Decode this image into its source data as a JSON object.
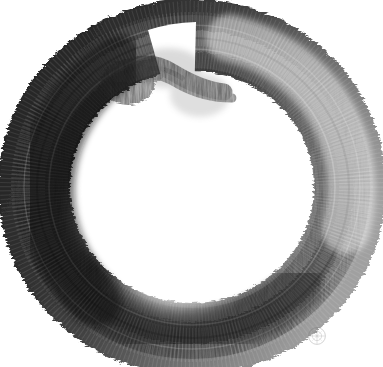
{
  "artwork": {
    "title": "Enso",
    "subject": "enso-zen-circle",
    "medium": "sumi ink brush painting",
    "orientation": "portrait",
    "canvas": {
      "width": 383,
      "height": 367
    },
    "background_color": "#ffffff"
  },
  "ring": {
    "name": "enso-brush-ring",
    "center_x": 192,
    "center_y": 187,
    "radius_x": 160,
    "radius_y": 155,
    "stroke_width": 66,
    "gap_present": true,
    "gap_angle_deg": 285,
    "overlap_point_x": 150,
    "overlap_point_y": 80,
    "direction": "counter-clockwise",
    "texture": "dry-brush radial bristle striations",
    "edge_quality": "ragged serrated outer edge, soft feathered inner edge"
  },
  "tones": {
    "darkest": "#161616",
    "dark": "#2b2b2b",
    "mid_dark": "#3f3f3f",
    "mid": "#595959",
    "mid_light": "#7d7d7d",
    "light": "#a2a2a2",
    "lightest": "#c9c9c9",
    "paper": "#ffffff",
    "highlight_glow": "#ffffff"
  },
  "regions": [
    {
      "name": "top-left-arc",
      "tone": "#2e2e2e",
      "note": "dense dark ink, heavy load"
    },
    {
      "name": "left-arc",
      "tone": "#232323",
      "note": "darkest mass, ragged outer bristles"
    },
    {
      "name": "bottom-left-arc",
      "tone": "#2a2a2a",
      "note": "dark with white glow at inner edge"
    },
    {
      "name": "bottom-arc",
      "tone": "#333333",
      "note": "dark, strong serrated outer edge"
    },
    {
      "name": "bottom-right-arc",
      "tone": "#3a3a3a",
      "note": "dark grey, banded"
    },
    {
      "name": "right-arc",
      "tone": "#6d6d6d",
      "note": "lighter grey, drying brush, visible bands"
    },
    {
      "name": "top-right-arc",
      "tone": "#7f7f7f",
      "note": "lightest, brush running dry"
    },
    {
      "name": "top-arc",
      "tone": "#474747",
      "note": "stroke start, overlapping tail"
    }
  ],
  "highlight": {
    "name": "inner-glow",
    "center_x": 180,
    "center_y": 268,
    "radius": 58,
    "color": "#ffffff",
    "note": "bright blown-out glow on lower inner edge"
  },
  "seal": {
    "name": "artist-seal",
    "x": 306,
    "y": 325,
    "size": 22,
    "color": "#6a6a6a",
    "opacity": 0.3,
    "shape": "circular monogram stamp",
    "label": "artist seal"
  }
}
